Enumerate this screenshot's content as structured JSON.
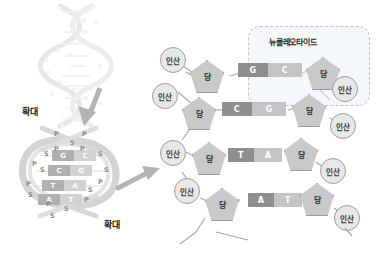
{
  "figure": {
    "background": "#ffffff"
  },
  "colors": {
    "base_dark": "#8e8e8e",
    "base_light": "#c4c4c4",
    "sugar_fill": "#c9c9c9",
    "phosphate_fill": "#e8e8e8",
    "outline": "#9a9a9a",
    "callout_border": "#b9c7cf",
    "arrow": "#b3b3b3",
    "ladder_band": "#d8d8d8"
  },
  "labels": {
    "phosphate": "인산",
    "sugar": "당",
    "nucleotide": "뉴클레오타이드",
    "zoom": "확대",
    "backbone_phosphate_short": "P",
    "backbone_sugar_short": "S"
  },
  "left_panel": {
    "helix": {
      "name": "dna-double-helix",
      "zoom_label": "확대",
      "rung_count": 11
    },
    "ladder": {
      "name": "dna-ladder",
      "zoom_label": "확대",
      "base_pairs": [
        {
          "left": "G",
          "right": "C"
        },
        {
          "left": "C",
          "right": "G"
        },
        {
          "left": "T",
          "right": "A"
        },
        {
          "left": "A",
          "right": "T"
        }
      ],
      "backbone_labels_top": [
        "P",
        "P",
        "S",
        "P",
        "P"
      ],
      "backbone_labels_left": [
        "S",
        "P",
        "S",
        "P",
        "S"
      ],
      "backbone_labels_right": [
        "S",
        "S",
        "P",
        "S",
        "P"
      ],
      "backbone_labels_bottom": [
        "P",
        "S",
        "S"
      ]
    },
    "arrows": [
      {
        "name": "arrow-down-to-ladder",
        "direction": "down"
      },
      {
        "name": "arrow-right-to-nucleotide",
        "direction": "right"
      }
    ]
  },
  "right_panel": {
    "name": "nucleotide-detail",
    "callout": {
      "label": "뉴클레오타이드"
    },
    "rows": [
      {
        "id": "row-gc",
        "left_phosphate": "인산",
        "left_sugar": "당",
        "base_left": "G",
        "base_right": "C",
        "right_sugar": "당",
        "right_phosphate": "인산"
      },
      {
        "id": "row-cg",
        "left_phosphate": "인산",
        "left_sugar": "당",
        "base_left": "C",
        "base_right": "G",
        "right_sugar": "당",
        "right_phosphate": "인산"
      },
      {
        "id": "row-ta",
        "left_phosphate": "인산",
        "left_sugar": "당",
        "base_left": "T",
        "base_right": "A",
        "right_sugar": "당",
        "right_phosphate": "인산"
      },
      {
        "id": "row-at",
        "left_phosphate": "인산",
        "left_sugar": "당",
        "base_left": "A",
        "base_right": "T",
        "right_sugar": "당",
        "right_phosphate": "인산"
      }
    ]
  }
}
